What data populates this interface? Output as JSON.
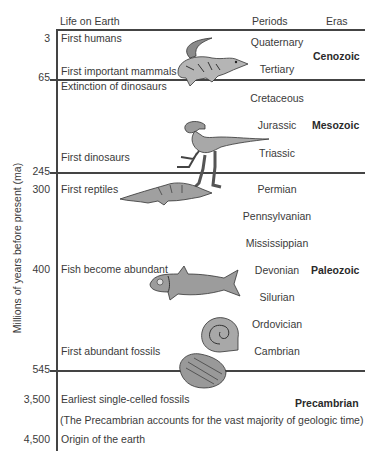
{
  "headers": {
    "life": "Life on Earth",
    "periods": "Periods",
    "eras": "Eras"
  },
  "axis_label": "Millions of years before present (ma)",
  "years": [
    "3",
    "65",
    "245",
    "300",
    "400",
    "545",
    "3,500",
    "4,500"
  ],
  "events": [
    "First humans",
    "First important mammals",
    "Extinction of dinosaurs",
    "First dinosaurs",
    "First reptiles",
    "Fish become abundant",
    "First abundant fossils",
    "Earliest single-celled fossils",
    "(The Precambrian accounts for the vast majority of geologic time)",
    "Origin of the earth"
  ],
  "periods": [
    "Quaternary",
    "Tertiary",
    "Cretaceous",
    "Jurassic",
    "Triassic",
    "Permian",
    "Pennsylvanian",
    "Mississippian",
    "Devonian",
    "Silurian",
    "Ordovician",
    "Cambrian"
  ],
  "eras": [
    "Cenozoic",
    "Mesozoic",
    "Paleozoic",
    "Precambrian"
  ],
  "illustrations": [
    "mammal",
    "dinosaur",
    "reptile",
    "fish",
    "ammonite",
    "trilobite"
  ]
}
